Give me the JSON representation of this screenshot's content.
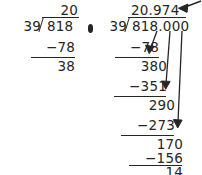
{
  "page": {
    "background_color": "#ffffff",
    "ink_color": "#262626",
    "separator_glyph": "bullet-diamond"
  },
  "problems": [
    {
      "id": "left",
      "title": "integer-quotient-partial",
      "divisor": "39",
      "dividend": "818",
      "quotient": "20",
      "steps": [
        {
          "label": "subtrahend-1",
          "text": "−78"
        },
        {
          "label": "remainder-1",
          "text": "38"
        }
      ]
    },
    {
      "id": "right",
      "title": "decimal-quotient-complete",
      "divisor": "39",
      "dividend": "818.000",
      "quotient": "20.974",
      "steps": [
        {
          "label": "subtrahend-1",
          "text": "−78"
        },
        {
          "label": "bringdown-1",
          "text": "380"
        },
        {
          "label": "subtrahend-2",
          "text": "−351"
        },
        {
          "label": "bringdown-2",
          "text": "290"
        },
        {
          "label": "subtrahend-3",
          "text": "−273"
        },
        {
          "label": "bringdown-3",
          "text": "170"
        },
        {
          "label": "subtrahend-4",
          "text": "−156"
        },
        {
          "label": "remainder-final",
          "text": "14"
        }
      ]
    }
  ],
  "annotations": {
    "quotient_pointer": "arrow-pointing-to-quotient",
    "bringdown_arrows": 3
  }
}
